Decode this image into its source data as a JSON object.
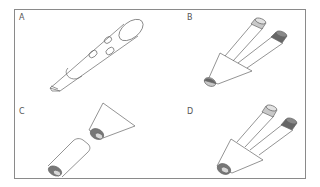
{
  "figure": {
    "panels": [
      {
        "id": "A",
        "label": "A",
        "description": "Single cylindrical pen-like device with three oval buttons and a rounded cap"
      },
      {
        "id": "B",
        "label": "B",
        "description": "Conical nozzle with two tubes attached; light-gray and dark-gray caps; half-shaded tip"
      },
      {
        "id": "C",
        "label": "C",
        "description": "Cylinder separated from conical nozzle; dark rings with light centers at ends"
      },
      {
        "id": "D",
        "label": "D",
        "description": "Conical nozzle with two tubes; light-gray and dark-gray caps; ringed open tip"
      }
    ],
    "colors": {
      "frame": "#8a8a8a",
      "line": "#555555",
      "light_fill": "#c8c8c8",
      "dark_fill": "#666666",
      "ring_fill": "#7a7a7a",
      "center_fill": "#d8d8d8"
    }
  }
}
